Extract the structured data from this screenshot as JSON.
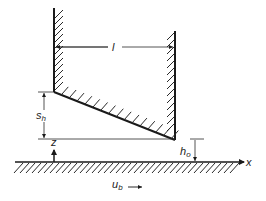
{
  "figure": {
    "labels": {
      "length": "l",
      "step_height_main": "s",
      "step_height_sub": "h",
      "min_film_main": "h",
      "min_film_sub": "o",
      "z_axis": "z",
      "x_axis": "x",
      "velocity_main": "u",
      "velocity_sub": "b"
    },
    "colors": {
      "line": "#1a1a1a",
      "background": "#ffffff"
    }
  }
}
